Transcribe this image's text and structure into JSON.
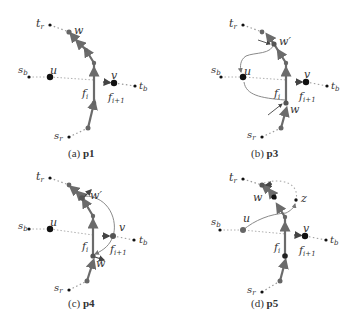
{
  "colors": {
    "red_path": "#6b6b6b",
    "node": "#111111",
    "node_gray": "#777777",
    "dotted": "#9a9a9a",
    "curve": "#8a8a8a",
    "text": "#333333"
  },
  "panels": [
    {
      "id": "a",
      "caption_prefix": "(a)",
      "caption_bold": "p1",
      "labels": {
        "tr": "t",
        "tr_sub": "r",
        "sr": "s",
        "sr_sub": "r",
        "sb": "s",
        "sb_sub": "b",
        "tb": "t",
        "tb_sub": "b",
        "u": "u",
        "v": "v",
        "w": "w",
        "fi": "f",
        "fi_sub": "i",
        "fi1": "f",
        "fi1_sub": "i+1"
      }
    },
    {
      "id": "b",
      "caption_prefix": "(b)",
      "caption_bold": "p3",
      "labels": {
        "tr": "t",
        "tr_sub": "r",
        "sr": "s",
        "sr_sub": "r",
        "sb": "s",
        "sb_sub": "b",
        "tb": "t",
        "tb_sub": "b",
        "u": "u",
        "v": "v",
        "w": "w",
        "wp": "w′",
        "fi": "f",
        "fi_sub": "i",
        "fi1": "f",
        "fi1_sub": "i+1"
      }
    },
    {
      "id": "c",
      "caption_prefix": "(c)",
      "caption_bold": "p4",
      "labels": {
        "tr": "t",
        "tr_sub": "r",
        "sr": "s",
        "sr_sub": "r",
        "sb": "s",
        "sb_sub": "b",
        "tb": "t",
        "tb_sub": "b",
        "u": "u",
        "v": "v",
        "w": "w",
        "wp": "w′",
        "fi": "f",
        "fi_sub": "i",
        "fi1": "f",
        "fi1_sub": "i+1"
      }
    },
    {
      "id": "d",
      "caption_prefix": "(d)",
      "caption_bold": "p5",
      "labels": {
        "tr": "t",
        "tr_sub": "r",
        "sr": "s",
        "sr_sub": "r",
        "sb": "s",
        "sb_sub": "b",
        "tb": "t",
        "tb_sub": "b",
        "u": "u",
        "v": "v",
        "w": "w",
        "z": "z",
        "fi": "f",
        "fi_sub": "i",
        "fi1": "f",
        "fi1_sub": "i+1"
      }
    }
  ]
}
